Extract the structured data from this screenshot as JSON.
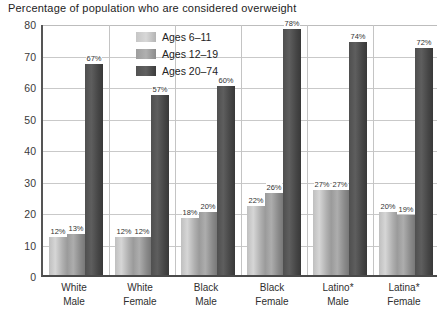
{
  "chart_data": {
    "type": "bar",
    "title": "Percentage of population who are considered overweight",
    "xlabel": "",
    "ylabel": "",
    "ylim": [
      0,
      80
    ],
    "yticks": [
      0,
      10,
      20,
      30,
      40,
      50,
      60,
      70,
      80
    ],
    "grid": true,
    "legend_position": "inside-top-center",
    "categories": [
      "White Male",
      "White Female",
      "Black Male",
      "Black Female",
      "Latino* Male",
      "Latina* Female"
    ],
    "category_lines": [
      [
        "White",
        "Male"
      ],
      [
        "White",
        "Female"
      ],
      [
        "Black",
        "Male"
      ],
      [
        "Black",
        "Female"
      ],
      [
        "Latino*",
        "Male"
      ],
      [
        "Latina*",
        "Female"
      ]
    ],
    "series": [
      {
        "name": "Ages 6–11",
        "color": "#c6c6c6",
        "values": [
          12,
          12,
          18,
          22,
          27,
          20
        ],
        "labels": [
          "12%",
          "12%",
          "18%",
          "22%",
          "27%",
          "20%"
        ]
      },
      {
        "name": "Ages 12–19",
        "color": "#9d9d9d",
        "values": [
          13,
          12,
          20,
          26,
          27,
          19
        ],
        "labels": [
          "13%",
          "12%",
          "20%",
          "26%",
          "27%",
          "19%"
        ]
      },
      {
        "name": "Ages 20–74",
        "color": "#4f4f4f",
        "values": [
          67,
          57,
          60,
          78,
          74,
          72
        ],
        "labels": [
          "67%",
          "57%",
          "60%",
          "78%",
          "74%",
          "72%"
        ]
      }
    ]
  },
  "legend": {
    "items": [
      {
        "label": "Ages 6–11"
      },
      {
        "label": "Ages 12–19"
      },
      {
        "label": "Ages 20–74"
      }
    ]
  },
  "axis": {
    "y_tick_labels": [
      "80",
      "70",
      "60",
      "50",
      "40",
      "30",
      "20",
      "10",
      "0"
    ]
  }
}
